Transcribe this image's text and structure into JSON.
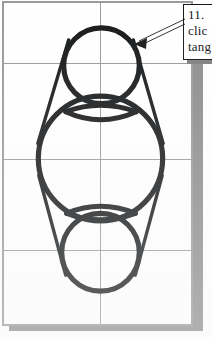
{
  "document": {
    "kind": "cad-drawing-screenshot",
    "background_color": "#ffffff",
    "sheet_color": "#ffffff",
    "sheet_border_color": "#9a9a9a",
    "shadow_color": "#8d8d8d",
    "ink_color": "#16181a",
    "grid_color": "#9a9a9a"
  },
  "drawing": {
    "title": "Tangent circles construction",
    "grid": {
      "vertical_x": [
        0,
        98,
        190
      ],
      "horizontal_y": [
        0,
        61,
        157,
        249,
        323
      ],
      "stroke_width": 1
    },
    "shapes": [
      {
        "name": "top-circle",
        "type": "circle",
        "cx": 99,
        "cy": 64,
        "r": 38,
        "stroke_width": 5
      },
      {
        "name": "middle-circle",
        "type": "circle",
        "cx": 98,
        "cy": 157,
        "r": 63,
        "stroke_width": 5
      },
      {
        "name": "bottom-circle",
        "type": "circle",
        "cx": 98,
        "cy": 251,
        "r": 39,
        "stroke_width": 5
      },
      {
        "name": "upper-lens-arc",
        "type": "arc",
        "cx": 98,
        "cy": 116,
        "rx": 36,
        "ry": 14,
        "stroke_width": 5
      },
      {
        "name": "lower-lens-arc",
        "type": "arc",
        "cx": 98,
        "cy": 206,
        "rx": 36,
        "ry": 13,
        "stroke_width": 5
      }
    ],
    "tangent_lines": [
      {
        "name": "tangent-upper-left",
        "x1": 66,
        "y1": 38,
        "x2": 36,
        "y2": 140
      },
      {
        "name": "tangent-upper-right",
        "x1": 131,
        "y1": 38,
        "x2": 161,
        "y2": 140
      },
      {
        "name": "tangent-lower-left",
        "x1": 37,
        "y1": 176,
        "x2": 64,
        "y2": 272
      },
      {
        "name": "tangent-lower-right",
        "x1": 160,
        "y1": 176,
        "x2": 133,
        "y2": 272
      }
    ]
  },
  "callout": {
    "name": "instruction-callout",
    "lines": [
      "11.",
      "clic",
      "tang"
    ],
    "border_color": "#16181a",
    "background_color": "#ffffff",
    "arrow": {
      "name": "leader-arrow",
      "from_x": 186,
      "from_y": 22,
      "to_x": 136,
      "to_y": 44,
      "style": "double-line-with-solid-head"
    }
  }
}
